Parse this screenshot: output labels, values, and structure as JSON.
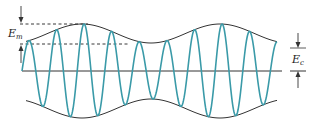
{
  "diagram": {
    "labels": {
      "modulation_amplitude": {
        "main": "E",
        "sub": "m"
      },
      "carrier_amplitude": {
        "main": "E",
        "sub": "c"
      }
    },
    "colors": {
      "carrier_wave": "#3a9aa8",
      "envelope": "#333333",
      "axis": "#333333",
      "dashed_guides": "#222222",
      "arrows": "#333333"
    },
    "geometry": {
      "axis_y": 71,
      "axis_x_start": 22,
      "axis_x_end": 282,
      "carrier_x_start": 22,
      "carrier_x_end": 277,
      "carrier_period": 27.6,
      "envelope_x_start": 26,
      "envelope_x_end": 277,
      "envelope_period": 138,
      "envelope_peak_x": 82,
      "mean_amplitude": 37.5,
      "modulation_depth": 9.5,
      "dashed_top_y": 24,
      "dashed_mid_y": 44,
      "dashed_top_x_end": 88,
      "dashed_mid_x_end": 130
    }
  }
}
